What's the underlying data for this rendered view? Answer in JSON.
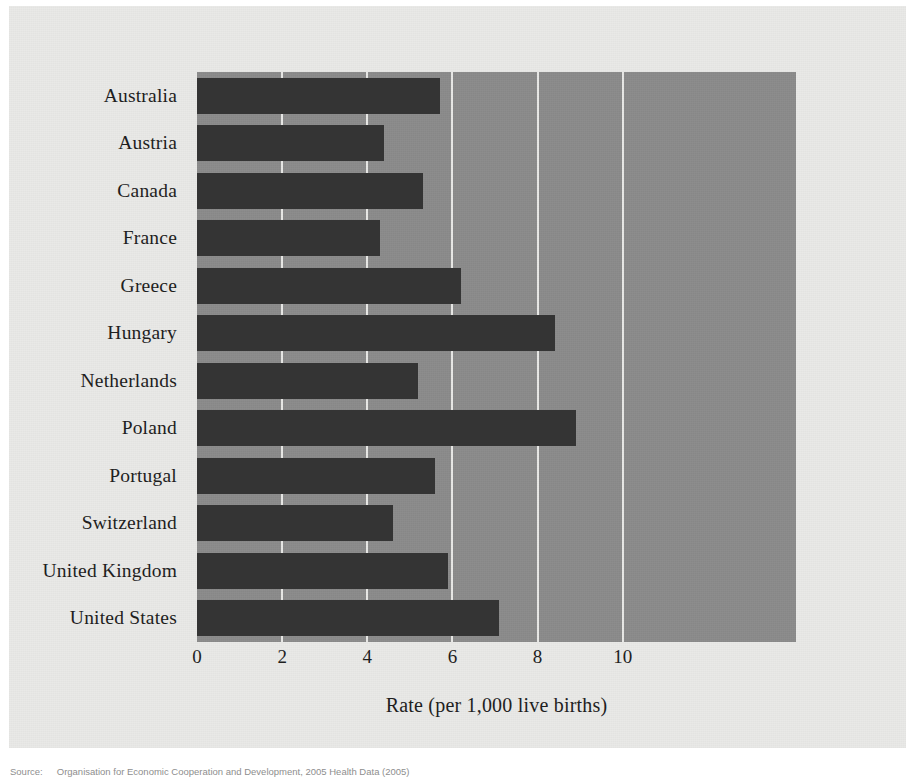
{
  "figure": {
    "x_axis_title": "Rate (per 1,000 live births)",
    "source_label": "Source:",
    "source_text": "Organisation for Economic Cooperation and Development, 2005 Health Data (2005)"
  },
  "colors": {
    "page_background": "#ffffff",
    "panel_background": "#e9e9e7",
    "plot_background": "#8b8b8b",
    "bar_fill": "#343434",
    "gridline": "#f0f0ee",
    "text": "#1c1c1c"
  },
  "chart_data": {
    "type": "bar",
    "orientation": "horizontal",
    "title": "",
    "subtitle": "",
    "xlabel": "Rate (per 1,000 live births)",
    "ylabel": "",
    "xlim": [
      0,
      14.07
    ],
    "xticks": [
      0,
      2,
      4,
      6,
      8,
      10
    ],
    "xtick_labels": [
      "0",
      "2",
      "4",
      "6",
      "8",
      "10"
    ],
    "grid": true,
    "grid_axis": "x",
    "legend": false,
    "legend_position": "none",
    "categories": [
      "Australia",
      "Austria",
      "Canada",
      "France",
      "Greece",
      "Hungary",
      "Netherlands",
      "Poland",
      "Portugal",
      "Switzerland",
      "United Kingdom",
      "United States"
    ],
    "values": [
      5.7,
      4.4,
      5.3,
      4.3,
      6.2,
      8.4,
      5.2,
      8.9,
      5.6,
      4.6,
      5.9,
      7.1
    ]
  }
}
